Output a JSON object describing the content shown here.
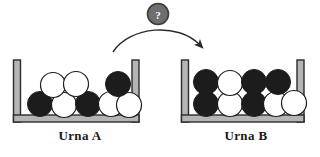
{
  "diagram": {
    "title_hidden": "",
    "background_color": "#ffffff"
  },
  "transfer": {
    "marker_label": "?",
    "marker_fill": "#6e6e6e",
    "marker_stroke": "#3d3d3d",
    "arrow_color": "#2b2b2b",
    "direction": "left-to-right"
  },
  "urns": [
    {
      "id": "urn-a",
      "label": "Urna A",
      "wall_fill": "#b5b5b5",
      "wall_stroke": "#2b2b2b",
      "balls": {
        "black_count": 3,
        "white_count": 5,
        "total": 8,
        "rows": [
          {
            "row": "top",
            "colors": [
              "white",
              "white",
              "black"
            ]
          },
          {
            "row": "bottom",
            "colors": [
              "black",
              "white",
              "black",
              "white",
              "white"
            ]
          }
        ]
      }
    },
    {
      "id": "urn-b",
      "label": "Urna B",
      "wall_fill": "#b5b5b5",
      "wall_stroke": "#2b2b2b",
      "balls": {
        "black_count": 5,
        "white_count": 4,
        "total": 9,
        "rows": [
          {
            "row": "top",
            "colors": [
              "black",
              "white",
              "black",
              "black"
            ]
          },
          {
            "row": "bottom",
            "colors": [
              "black",
              "white",
              "black",
              "white",
              "white"
            ]
          }
        ]
      }
    }
  ],
  "colors": {
    "ball_black": "#1c1c1c",
    "ball_white": "#ffffff",
    "ball_outline": "#1c1c1c",
    "text": "#1a1a1a"
  }
}
